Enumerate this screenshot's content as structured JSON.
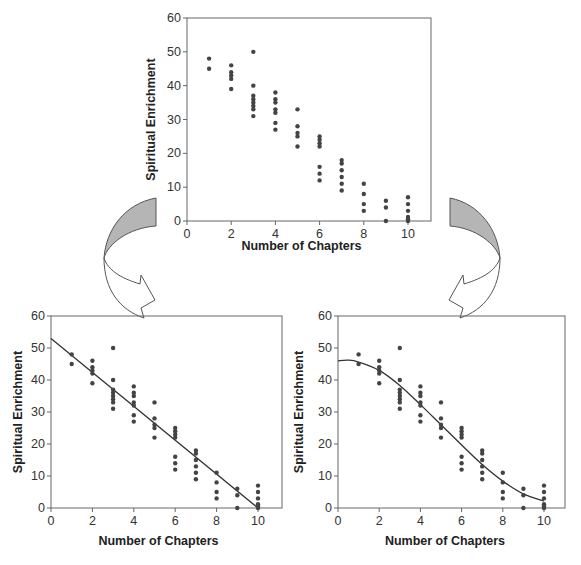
{
  "chart_data": [
    {
      "id": "top",
      "type": "scatter",
      "title": "",
      "xlabel": "Number of Chapters",
      "ylabel": "Spiritual Enrichment",
      "xlim": [
        0,
        11
      ],
      "ylim": [
        0,
        60
      ],
      "xticks": [
        0,
        2,
        4,
        6,
        8,
        10
      ],
      "yticks": [
        0,
        10,
        20,
        30,
        40,
        50,
        60
      ],
      "grid": false,
      "points": [
        [
          1,
          48
        ],
        [
          1,
          45
        ],
        [
          2,
          46
        ],
        [
          2,
          44
        ],
        [
          2,
          43
        ],
        [
          2,
          42
        ],
        [
          2,
          39
        ],
        [
          3,
          50
        ],
        [
          3,
          40
        ],
        [
          3,
          37
        ],
        [
          3,
          36
        ],
        [
          3,
          35
        ],
        [
          3,
          34
        ],
        [
          3,
          33
        ],
        [
          3,
          31
        ],
        [
          4,
          38
        ],
        [
          4,
          36
        ],
        [
          4,
          35
        ],
        [
          4,
          33
        ],
        [
          4,
          32
        ],
        [
          4,
          29
        ],
        [
          4,
          27
        ],
        [
          5,
          33
        ],
        [
          5,
          28
        ],
        [
          5,
          26
        ],
        [
          5,
          25
        ],
        [
          5,
          22
        ],
        [
          6,
          25
        ],
        [
          6,
          24
        ],
        [
          6,
          23
        ],
        [
          6,
          22
        ],
        [
          6,
          16
        ],
        [
          6,
          14
        ],
        [
          6,
          12
        ],
        [
          7,
          18
        ],
        [
          7,
          17
        ],
        [
          7,
          15
        ],
        [
          7,
          13
        ],
        [
          7,
          11
        ],
        [
          7,
          9
        ],
        [
          8,
          11
        ],
        [
          8,
          8
        ],
        [
          8,
          5
        ],
        [
          8,
          3
        ],
        [
          9,
          6
        ],
        [
          9,
          4
        ],
        [
          9,
          0
        ],
        [
          10,
          7
        ],
        [
          10,
          5
        ],
        [
          10,
          3
        ],
        [
          10,
          1.2
        ],
        [
          10,
          0.5
        ],
        [
          10,
          0
        ]
      ]
    },
    {
      "id": "bottom-left",
      "type": "scatter",
      "title": "",
      "xlabel": "Number of Chapters",
      "ylabel": "Spiritual Enrichment",
      "xlim": [
        0,
        11
      ],
      "ylim": [
        0,
        60
      ],
      "xticks": [
        0,
        2,
        4,
        6,
        8,
        10
      ],
      "yticks": [
        0,
        10,
        20,
        30,
        40,
        50,
        60
      ],
      "grid": false,
      "fit": {
        "kind": "linear",
        "line": [
          [
            0,
            53
          ],
          [
            10,
            0
          ]
        ]
      },
      "points_ref": "top"
    },
    {
      "id": "bottom-right",
      "type": "scatter",
      "title": "",
      "xlabel": "Number of Chapters",
      "ylabel": "Spiritual Enrichment",
      "xlim": [
        0,
        11
      ],
      "ylim": [
        0,
        60
      ],
      "xticks": [
        0,
        2,
        4,
        6,
        8,
        10
      ],
      "yticks": [
        0,
        10,
        20,
        30,
        40,
        50,
        60
      ],
      "grid": false,
      "fit": {
        "kind": "curve",
        "line": [
          [
            0,
            46
          ],
          [
            0.5,
            46.2
          ],
          [
            1,
            45.6
          ],
          [
            2,
            43
          ],
          [
            3,
            38.3
          ],
          [
            4,
            32.3
          ],
          [
            5,
            26
          ],
          [
            6,
            19.7
          ],
          [
            7,
            13.6
          ],
          [
            8,
            8.4
          ],
          [
            9,
            4.4
          ],
          [
            10,
            2.2
          ]
        ]
      },
      "points_ref": "top"
    }
  ],
  "labels": {
    "xlabel": "Number of Chapters",
    "ylabel": "Spiritual Enrichment"
  },
  "colors": {
    "axis": "#666666",
    "point": "#444444",
    "fit_line": "#333333",
    "arrow_fill": "#b5b5b5",
    "arrow_stroke": "#555555"
  }
}
